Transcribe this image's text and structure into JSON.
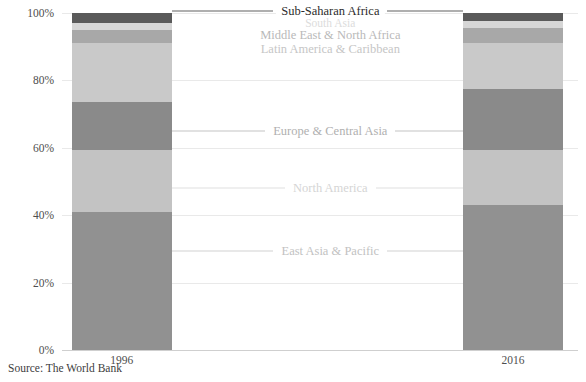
{
  "chart_data": {
    "type": "bar",
    "subtype": "stacked-100-percent",
    "title": "",
    "subtitle": "",
    "xlabel": "",
    "ylabel": "",
    "categories": [
      "1996",
      "2016"
    ],
    "ylim": [
      0,
      100
    ],
    "ytick_labels": [
      "0%",
      "20%",
      "40%",
      "60%",
      "80%",
      "100%"
    ],
    "ytick_values": [
      0,
      20,
      40,
      60,
      80,
      100
    ],
    "grid": true,
    "legend": "inline-annotations",
    "series": [
      {
        "name": "East Asia & Pacific",
        "color": "#919191",
        "values": [
          41.0,
          43.0
        ],
        "label_color": "#c8c8c8"
      },
      {
        "name": "North America",
        "color": "#c3c3c3",
        "values": [
          18.5,
          16.5
        ],
        "label_color": "#dcdcdc"
      },
      {
        "name": "Europe & Central Asia",
        "color": "#8a8a8a",
        "values": [
          14.0,
          18.0
        ],
        "label_color": "#b4b4b4"
      },
      {
        "name": "Latin America & Caribbean",
        "color": "#c9c9c9",
        "values": [
          17.5,
          13.5
        ],
        "label_color": "#cfcfcf"
      },
      {
        "name": "Middle East & North Africa",
        "color": "#a8a8a8",
        "values": [
          4.0,
          4.5
        ],
        "label_color": "#b8b8b8"
      },
      {
        "name": "South Asia",
        "color": "#d6d6d6",
        "values": [
          2.0,
          2.0
        ],
        "label_color": "#e0e0e0"
      },
      {
        "name": "Sub-Saharan Africa",
        "color": "#5a5a5a",
        "values": [
          3.0,
          2.5
        ],
        "label_color": "#2b2b2b"
      }
    ],
    "annotations": [
      {
        "text": "Sub-Saharan Africa",
        "x_pct": 52.0,
        "y_pct": 100.6,
        "color": "#2b2b2b",
        "size": 12.5,
        "leader_left": true,
        "leader_right": true
      },
      {
        "text": "South Asia",
        "x_pct": 52.0,
        "y_pct": 97.0,
        "color": "#dcdcdc",
        "size": 11.5,
        "leader_left": false,
        "leader_right": false
      },
      {
        "text": "Middle East & North Africa",
        "x_pct": 52.0,
        "y_pct": 93.4,
        "color": "#b9b9b9",
        "size": 12.5,
        "leader_left": false,
        "leader_right": false
      },
      {
        "text": "Latin America & Caribbean",
        "x_pct": 52.0,
        "y_pct": 89.4,
        "color": "#c6c6c6",
        "size": 12.5,
        "leader_left": false,
        "leader_right": false
      },
      {
        "text": "Europe & Central Asia",
        "x_pct": 52.0,
        "y_pct": 65.0,
        "color": "#b0b0b0",
        "size": 12.5,
        "leader_left": true,
        "leader_right": true
      },
      {
        "text": "North America",
        "x_pct": 52.0,
        "y_pct": 48.0,
        "color": "#d5d5d5",
        "size": 12.5,
        "leader_left": true,
        "leader_right": true
      },
      {
        "text": "East Asia & Pacific",
        "x_pct": 52.0,
        "y_pct": 29.5,
        "color": "#c2c2c2",
        "size": 12.5,
        "leader_left": true,
        "leader_right": true
      }
    ],
    "bars": [
      {
        "category": "1996",
        "center_pct": 11.6,
        "width_pct": 19.4
      },
      {
        "category": "2016",
        "center_pct": 87.4,
        "width_pct": 19.4
      }
    ]
  },
  "footer": {
    "source": "Source: The World Bank"
  },
  "colors": {
    "background": "#ffffff",
    "gridline": "#e9e9e9",
    "axis_text": "#4e4e4e",
    "source_text": "#3d3d3d"
  }
}
